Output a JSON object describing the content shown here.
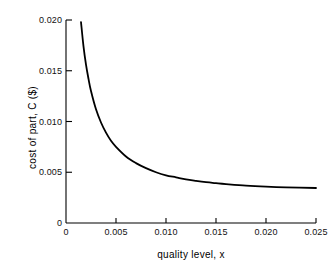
{
  "chart_data": {
    "type": "line",
    "title": "",
    "xlabel": "quality level, x",
    "ylabel": "cost of part, C ($)",
    "xlim": [
      0,
      0.025
    ],
    "ylim": [
      0,
      0.02
    ],
    "grid": false,
    "legend": "none",
    "xticks": [
      0,
      0.005,
      0.01,
      0.015,
      0.02,
      0.025
    ],
    "xticklabels": [
      "0",
      "0.005",
      "0.010",
      "0.015",
      "0.020",
      "0.025"
    ],
    "yticks": [
      0,
      0.005,
      0.01,
      0.015,
      0.02
    ],
    "yticklabels": [
      "0",
      "0.005",
      "0.010",
      "0.015",
      "0.020"
    ],
    "series": [
      {
        "name": "cost of part",
        "color": "#000000",
        "linewidth": 1.8,
        "x": [
          0.0015,
          0.00175,
          0.002,
          0.00225,
          0.0025,
          0.003,
          0.0035,
          0.004,
          0.0045,
          0.005,
          0.006,
          0.007,
          0.008,
          0.009,
          0.01,
          0.011,
          0.012,
          0.013,
          0.014,
          0.015,
          0.016,
          0.018,
          0.02,
          0.022,
          0.025
        ],
        "y": [
          0.0198,
          0.0174,
          0.0156,
          0.0142,
          0.013,
          0.0112,
          0.0099,
          0.0089,
          0.0081,
          0.0075,
          0.00655,
          0.0059,
          0.0054,
          0.005,
          0.0047,
          0.0045,
          0.0043,
          0.00415,
          0.00402,
          0.00392,
          0.00383,
          0.00368,
          0.00358,
          0.00351,
          0.00345
        ]
      }
    ]
  },
  "axes": {
    "x_title": "quality level, x",
    "y_title": "cost of part, C ($)",
    "x_tick_labels": [
      "0",
      "0.005",
      "0.010",
      "0.015",
      "0.020",
      "0.025"
    ],
    "y_tick_labels": [
      "0",
      "0.005",
      "0.010",
      "0.015",
      "0.020"
    ]
  },
  "colors": {
    "curve": "#000000",
    "axis": "#000000",
    "background": "#ffffff"
  }
}
